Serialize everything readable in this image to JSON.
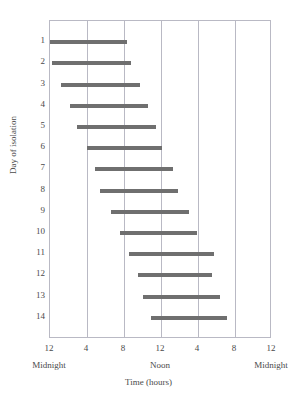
{
  "chart_data": {
    "type": "bar",
    "title": "",
    "subtitle": "",
    "xlabel": "Time (hours)",
    "ylabel": "Day of isolation",
    "orientation": "horizontal",
    "xlim": [
      0,
      24
    ],
    "xtick_values": [
      0,
      4,
      8,
      12,
      16,
      20,
      24
    ],
    "xtick_labels": [
      "12",
      "4",
      "8",
      "12",
      "4",
      "8",
      "12"
    ],
    "x_period_labels": [
      {
        "label": "Midnight",
        "at": 0
      },
      {
        "label": "Noon",
        "at": 12
      },
      {
        "label": "Midnight",
        "at": 24
      }
    ],
    "ylim": [
      0.5,
      14.5
    ],
    "ytick_labels": [
      "1",
      "2",
      "3",
      "4",
      "5",
      "6",
      "7",
      "8",
      "9",
      "10",
      "11",
      "12",
      "13",
      "14"
    ],
    "grid": "vertical-only",
    "legend": "none",
    "bar_color": "#6f6f6f",
    "frame_color": "#b9b9c4",
    "categories": [
      1,
      2,
      3,
      4,
      5,
      6,
      7,
      8,
      9,
      10,
      11,
      12,
      13,
      14
    ],
    "bars": [
      {
        "day": 1,
        "start": 0.0,
        "end": 8.3
      },
      {
        "day": 2,
        "start": 0.2,
        "end": 8.8
      },
      {
        "day": 3,
        "start": 1.2,
        "end": 9.7
      },
      {
        "day": 4,
        "start": 2.2,
        "end": 10.6
      },
      {
        "day": 5,
        "start": 2.9,
        "end": 11.5
      },
      {
        "day": 6,
        "start": 4.0,
        "end": 12.1
      },
      {
        "day": 7,
        "start": 4.9,
        "end": 13.3
      },
      {
        "day": 8,
        "start": 5.4,
        "end": 13.8
      },
      {
        "day": 9,
        "start": 6.6,
        "end": 15.0
      },
      {
        "day": 10,
        "start": 7.6,
        "end": 15.9
      },
      {
        "day": 11,
        "start": 8.5,
        "end": 17.7
      },
      {
        "day": 12,
        "start": 9.5,
        "end": 17.5
      },
      {
        "day": 13,
        "start": 10.1,
        "end": 18.4
      },
      {
        "day": 14,
        "start": 10.9,
        "end": 19.1
      }
    ]
  }
}
